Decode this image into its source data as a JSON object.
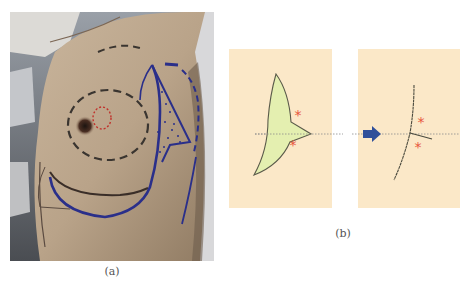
{
  "figure": {
    "panel_a": {
      "caption": "(a)",
      "description": "Clinical photograph of lateral breast with preoperative skin markings",
      "markings": {
        "inner_circle_color": "#c0302a",
        "dashed_ellipse_color": "#3a3530",
        "flap_outline_color": "#2a2f8a"
      }
    },
    "panel_b": {
      "caption": "(b)",
      "left_schematic": {
        "label": "flap-design",
        "asterisks": [
          "*",
          "*"
        ],
        "fill_color": "#e4efb0",
        "outline_color": "#5a5a4a"
      },
      "right_schematic": {
        "label": "closure-result",
        "asterisks": [
          "*",
          "*"
        ]
      },
      "arrow_icon": "right-arrow",
      "arrow_color": "#2f4f9a",
      "asterisk_color": "#e8553c",
      "panel_color": "#fbe8c8"
    }
  }
}
